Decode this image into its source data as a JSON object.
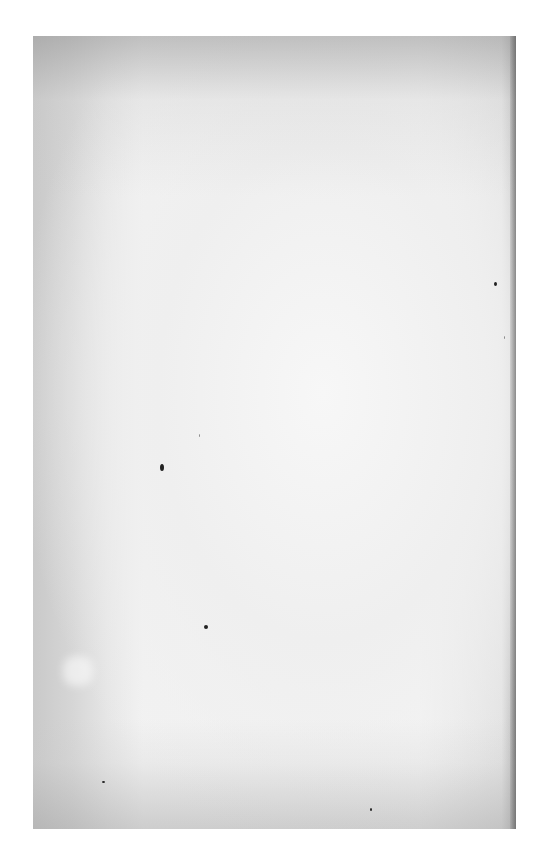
{
  "document": {
    "type": "scanned-page",
    "content": "",
    "paper_color": "#f0f0f0",
    "edge_shade_color": "#b8b8b8"
  }
}
